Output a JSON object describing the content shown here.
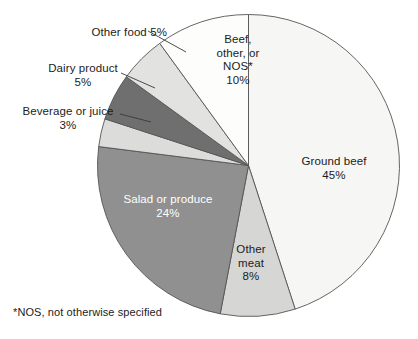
{
  "chart_data": {
    "type": "pie",
    "title": "",
    "subtitle": "",
    "xlabel": "",
    "ylabel": "",
    "units": "percent",
    "legend_position": "none",
    "grid": false,
    "start_angle_deg": 90,
    "direction": "clockwise",
    "categories": [
      "Ground beef",
      "Other meat",
      "Salad or produce",
      "Beverage or juice",
      "Dairy product",
      "Other food",
      "Beef, other, or NOS*"
    ],
    "values": [
      45,
      8,
      24,
      3,
      5,
      5,
      10
    ],
    "colors": [
      "#f6f6f4",
      "#d6d6d4",
      "#909090",
      "#dcdcda",
      "#6f6f6f",
      "#e2e2e0",
      "#fdfdfc"
    ],
    "slices": [
      {
        "label": "Ground beef",
        "value": 45,
        "value_text": "45%",
        "label_text": "Ground beef\n45%",
        "color": "#f6f6f4",
        "label_placement": "inside",
        "label_color": "#1c1c1c",
        "leader_line": false
      },
      {
        "label": "Other meat",
        "value": 8,
        "value_text": "8%",
        "label_text": "Other\nmeat\n8%",
        "color": "#d6d6d4",
        "label_placement": "inside",
        "label_color": "#1c1c1c",
        "leader_line": false
      },
      {
        "label": "Salad or produce",
        "value": 24,
        "value_text": "24%",
        "label_text": "Salad or produce\n24%",
        "color": "#909090",
        "label_placement": "inside",
        "label_color": "#ffffff",
        "leader_line": false
      },
      {
        "label": "Beverage or juice",
        "value": 3,
        "value_text": "3%",
        "label_text": "Beverage or juice\n3%",
        "color": "#dcdcda",
        "label_placement": "outside",
        "label_color": "#1c1c1c",
        "leader_line": true
      },
      {
        "label": "Dairy product",
        "value": 5,
        "value_text": "5%",
        "label_text": "Dairy product\n5%",
        "color": "#6f6f6f",
        "label_placement": "outside",
        "label_color": "#1c1c1c",
        "leader_line": true
      },
      {
        "label": "Other food",
        "value": 5,
        "value_text": "5%",
        "label_text": "Other food 5%",
        "color": "#e2e2e0",
        "label_placement": "outside",
        "label_color": "#1c1c1c",
        "leader_line": true
      },
      {
        "label": "Beef, other, or NOS*",
        "value": 10,
        "value_text": "10%",
        "label_text": "Beef,\nother, or\nNOS*\n10%",
        "color": "#fdfdfc",
        "label_placement": "inside",
        "label_color": "#1c1c1c",
        "leader_line": false
      }
    ],
    "footnote": "*NOS, not otherwise specified",
    "stroke_color": "#555555"
  },
  "figure": {
    "footnote": "*NOS, not otherwise specified",
    "background": "#ffffff"
  }
}
